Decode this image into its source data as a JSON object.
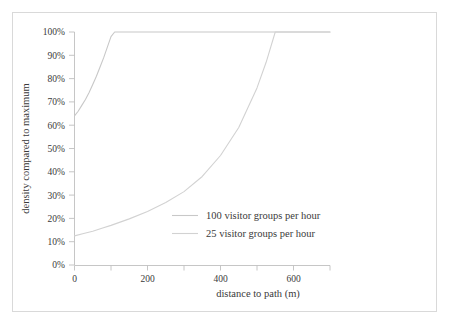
{
  "chart_data": {
    "type": "line",
    "title": "",
    "xlabel": "distance to path (m)",
    "ylabel": "density compared to maximum",
    "xlim": [
      0,
      700
    ],
    "ylim": [
      0,
      100
    ],
    "grid": false,
    "legend_position": "center",
    "x_ticks": [
      0,
      100,
      200,
      300,
      400,
      500,
      600,
      700
    ],
    "x_tick_labels": [
      "0",
      "",
      "200",
      "",
      "400",
      "",
      "600",
      ""
    ],
    "y_ticks": [
      0,
      10,
      20,
      30,
      40,
      50,
      60,
      70,
      80,
      90,
      100
    ],
    "y_tick_labels": [
      "0%",
      "10%",
      "20%",
      "30%",
      "40%",
      "50%",
      "60%",
      "70%",
      "80%",
      "90%",
      "100%"
    ],
    "series": [
      {
        "name": "100 visitor groups per hour",
        "color": "#c8c8c8",
        "x": [
          0,
          10,
          20,
          30,
          40,
          50,
          60,
          70,
          80,
          90,
          100,
          110,
          120,
          200,
          300,
          400,
          500,
          600,
          700
        ],
        "values": [
          64,
          66,
          68.5,
          71,
          74,
          77.5,
          81,
          85,
          89,
          93.5,
          98,
          100,
          100,
          100,
          100,
          100,
          100,
          100,
          100
        ]
      },
      {
        "name": "25 visitor groups per hour",
        "color": "#d2d2d2",
        "x": [
          0,
          25,
          50,
          75,
          100,
          150,
          200,
          250,
          300,
          350,
          400,
          450,
          500,
          525,
          550,
          600,
          650,
          700
        ],
        "values": [
          12.5,
          13.5,
          14.5,
          15.8,
          17,
          19.8,
          23,
          26.8,
          31.5,
          38,
          47,
          59,
          76,
          87,
          100,
          100,
          100,
          100
        ]
      }
    ]
  },
  "legend": {
    "entries": [
      {
        "label": "100 visitor groups per hour"
      },
      {
        "label": "25 visitor groups per hour"
      }
    ]
  },
  "axes": {
    "x_title": "distance to path (m)",
    "y_title": "density compared to maximum"
  },
  "colors": {
    "frame": "#d9d9d9",
    "axis": "#bfbfbf",
    "text": "#3a3a3a",
    "series_1": "#c8c8c8",
    "series_2": "#d2d2d2",
    "background": "#ffffff"
  }
}
